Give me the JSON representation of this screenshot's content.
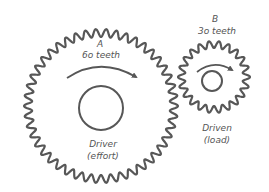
{
  "diagram": {
    "stroke_color": "#575757",
    "text_color": "#555555",
    "background": "#ffffff",
    "gear_a": {
      "letter": "A",
      "teeth_label": "6o teeth",
      "role": "Driver",
      "role_note": "(effort)",
      "center": [
        101,
        106
      ],
      "outer_radius": 77,
      "tooth_depth": 8,
      "visible_waves": 46,
      "hub_radius": 22,
      "rotation": "clockwise"
    },
    "gear_b": {
      "letter": "B",
      "teeth_label": "3o teeth",
      "role": "Driven",
      "role_note": "(load)",
      "center": [
        214,
        77
      ],
      "outer_radius": 36,
      "tooth_depth": 7,
      "visible_waves": 22,
      "hub_radius": 10,
      "rotation": "clockwise"
    }
  }
}
